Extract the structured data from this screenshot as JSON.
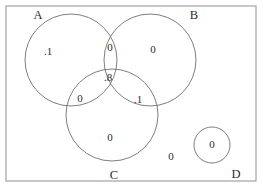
{
  "diagram": {
    "type": "venn",
    "frame": {
      "x": 6,
      "y": 6,
      "width": 250,
      "height": 175,
      "stroke": "#9a9a9a"
    },
    "circle_stroke": "#6f6f6f",
    "text_color": "#2b2b2b",
    "background": "#ffffff",
    "sets": [
      {
        "id": "A",
        "label": "A",
        "cx": 71,
        "cy": 60,
        "r": 46,
        "label_x": 38,
        "label_y": 16
      },
      {
        "id": "B",
        "label": "B",
        "cx": 150,
        "cy": 60,
        "r": 46,
        "label_x": 194,
        "label_y": 16
      },
      {
        "id": "C",
        "label": "C",
        "cx": 112,
        "cy": 115,
        "r": 46,
        "label_x": 114,
        "label_y": 176
      },
      {
        "id": "D",
        "label": "D",
        "cx": 212,
        "cy": 145,
        "r": 18,
        "label_x": 236,
        "label_y": 175
      }
    ],
    "regions": [
      {
        "id": "A-only",
        "value": ".1",
        "x": 48,
        "y": 52
      },
      {
        "id": "A-and-B",
        "value": "0",
        "x": 110,
        "y": 48
      },
      {
        "id": "B-only",
        "value": "0",
        "x": 153,
        "y": 50
      },
      {
        "id": "A-B-and-C",
        "value": ".8",
        "x": 108,
        "y": 78
      },
      {
        "id": "A-and-C",
        "value": "0",
        "x": 80,
        "y": 99
      },
      {
        "id": "B-and-C",
        "value": ".1",
        "x": 138,
        "y": 100
      },
      {
        "id": "C-only",
        "value": "0",
        "x": 110,
        "y": 138
      },
      {
        "id": "outside",
        "value": "0",
        "x": 171,
        "y": 157
      },
      {
        "id": "D-only",
        "value": "0",
        "x": 212,
        "y": 145
      }
    ]
  }
}
